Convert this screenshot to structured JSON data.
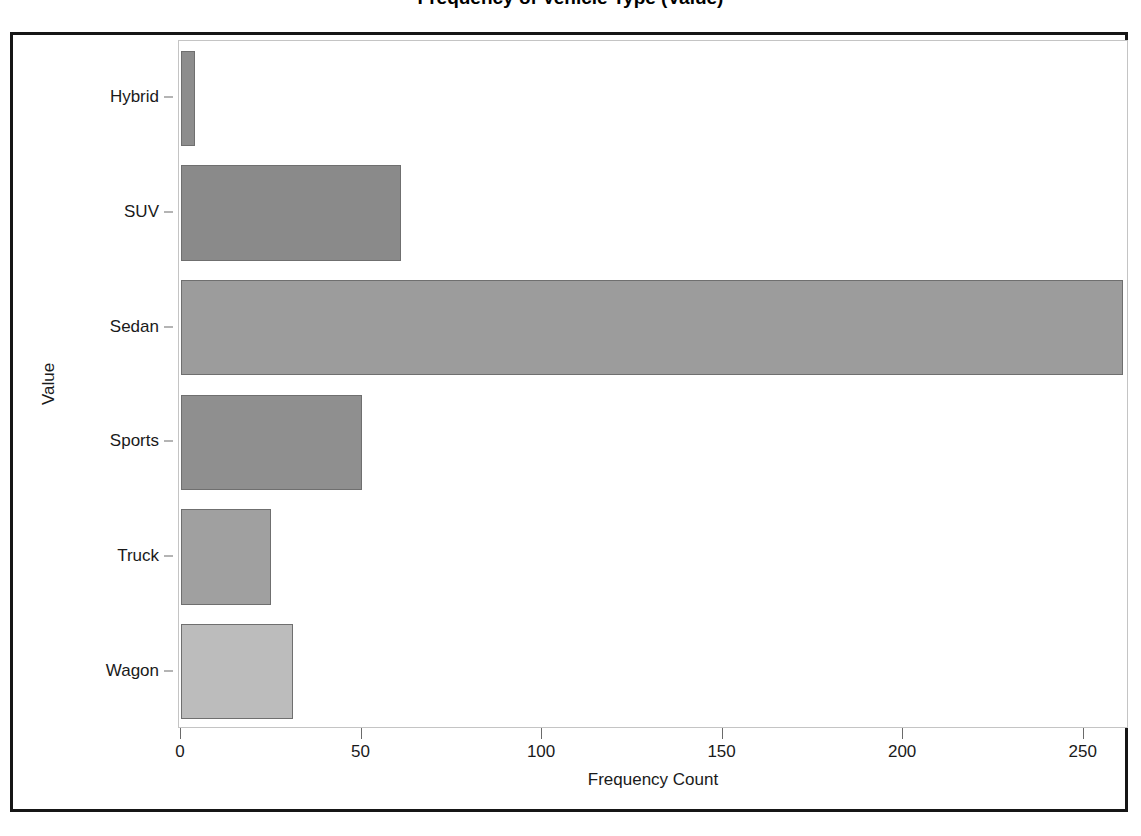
{
  "title": {
    "text": "Frequency of Vehicle Type (Value)",
    "note_clipped": "top of title is cut off by the screenshot crop"
  },
  "chart_data": {
    "type": "bar",
    "orientation": "horizontal",
    "title": "Frequency of Vehicle Type (Value)",
    "xlabel": "Frequency Count",
    "ylabel": "Value",
    "categories": [
      "Hybrid",
      "SUV",
      "Sedan",
      "Sports",
      "Truck",
      "Wagon"
    ],
    "values": [
      4,
      61,
      261,
      50,
      25,
      31
    ],
    "xlim": [
      0,
      262
    ],
    "xticks": [
      0,
      50,
      100,
      150,
      200,
      250
    ],
    "xtick_labels": [
      "0",
      "50",
      "100",
      "150",
      "200",
      "250"
    ],
    "grid": false,
    "legend": false,
    "bar_colors": [
      "#8d8d8d",
      "#8a8a8a",
      "#9c9c9c",
      "#8f8f8f",
      "#a0a0a0",
      "#bcbcbc"
    ],
    "bar_edge_color": "#6f6f6f"
  },
  "style": {
    "frame_color": "#161616",
    "plot_border_color": "#c4c4c4",
    "axis_color": "#6a6a6a",
    "text_color": "#1a1a1a",
    "background": "#ffffff"
  }
}
